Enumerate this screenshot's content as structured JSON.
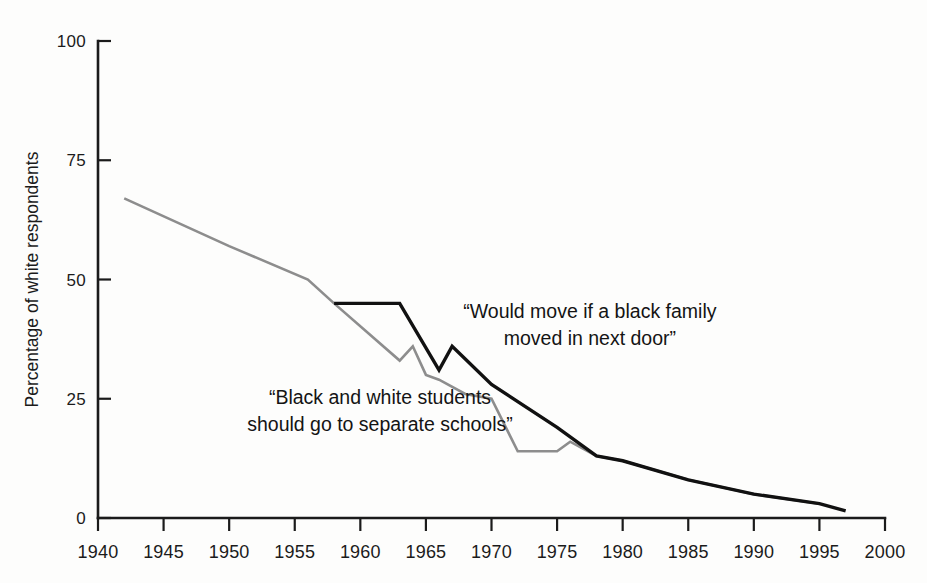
{
  "chart_data": {
    "type": "line",
    "title": "",
    "subtitle": "",
    "xlabel": "",
    "ylabel": "Percentage of white respondents",
    "xlim": [
      1940,
      2000
    ],
    "ylim": [
      0,
      100
    ],
    "grid": false,
    "legend_position": "inline-annotations",
    "x_ticks": [
      1940,
      1945,
      1950,
      1955,
      1960,
      1965,
      1970,
      1975,
      1980,
      1985,
      1990,
      1995,
      2000
    ],
    "y_ticks": [
      0,
      25,
      50,
      75,
      100
    ],
    "x_tick_labels": [
      "1940",
      "1945",
      "1950",
      "1955",
      "1960",
      "1965",
      "1970",
      "1975",
      "1980",
      "1985",
      "1990",
      "1995",
      "2000"
    ],
    "y_tick_labels": [
      "0",
      "25",
      "50",
      "75",
      "100"
    ],
    "series": [
      {
        "name": "“Black and white students should go to separate schools”",
        "color": "#8d8d8d",
        "linewidth": 2.6,
        "points": [
          [
            1942,
            67
          ],
          [
            1950,
            57
          ],
          [
            1956,
            50
          ],
          [
            1958,
            45
          ],
          [
            1963,
            33
          ],
          [
            1964,
            36
          ],
          [
            1965,
            30
          ],
          [
            1966,
            29
          ],
          [
            1968,
            26
          ],
          [
            1970,
            25
          ],
          [
            1972,
            14
          ],
          [
            1975,
            14
          ],
          [
            1976,
            16
          ],
          [
            1978,
            13
          ],
          [
            1980,
            12
          ],
          [
            1985,
            8
          ],
          [
            1990,
            5
          ],
          [
            1995,
            3
          ]
        ]
      },
      {
        "name": "“Would move if a black family moved in next door”",
        "color": "#111111",
        "linewidth": 3.4,
        "points": [
          [
            1958,
            45
          ],
          [
            1963,
            45
          ],
          [
            1966,
            31
          ],
          [
            1967,
            36
          ],
          [
            1970,
            28
          ],
          [
            1975,
            19
          ],
          [
            1978,
            13
          ],
          [
            1980,
            12
          ],
          [
            1985,
            8
          ],
          [
            1990,
            5
          ],
          [
            1995,
            3
          ],
          [
            1997,
            1.5
          ]
        ]
      }
    ],
    "annotations": [
      {
        "id": "annotation-would-move",
        "lines": [
          "“Would move if a black family",
          "moved in next door”"
        ],
        "x": 1977.5,
        "y": 42
      },
      {
        "id": "annotation-separate-schools",
        "lines": [
          "“Black and white students",
          "should go to separate schools”"
        ],
        "x": 1961.5,
        "y": 24
      }
    ]
  }
}
